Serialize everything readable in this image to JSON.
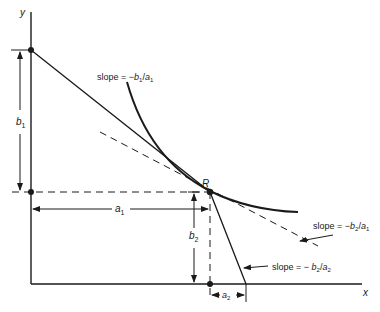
{
  "axes": {
    "x_label": "x",
    "y_label": "y"
  },
  "points": {
    "R": "R"
  },
  "dimensions": {
    "b1": {
      "var": "b",
      "sub": "1"
    },
    "b2": {
      "var": "b",
      "sub": "2"
    },
    "a1": {
      "var": "a",
      "sub": "1"
    },
    "a2": {
      "var": "a",
      "sub": "2"
    }
  },
  "annotations": {
    "slope_b1_a1": {
      "prefix": "slope = −",
      "num": "b",
      "num_sub": "1",
      "sep": "/",
      "den": "a",
      "den_sub": "1"
    },
    "slope_b2_a1": {
      "prefix": "slope = −",
      "num": "b",
      "num_sub": "2",
      "sep": "/",
      "den": "a",
      "den_sub": "1"
    },
    "slope_b2_a2": {
      "prefix": "slope = − ",
      "num": "b",
      "num_sub": "2",
      "sep": "/",
      "den": "a",
      "den_sub": "2"
    }
  },
  "colors": {
    "ink": "#1a1a1a",
    "background": "#ffffff"
  }
}
